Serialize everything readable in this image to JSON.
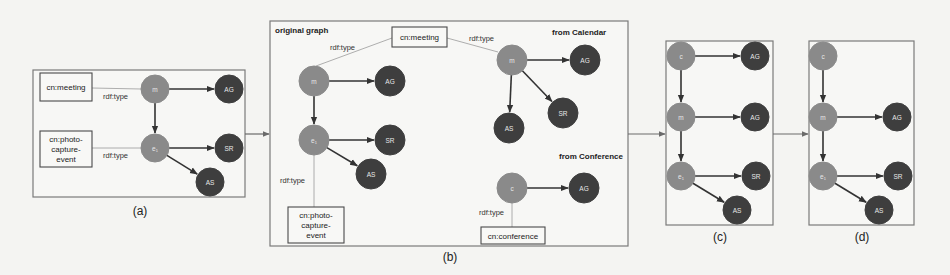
{
  "figure": {
    "background": "#f4f4f2",
    "colors": {
      "light_node": "#8a8a8a",
      "dark_node": "#3e3e3e",
      "edge": "#333333",
      "panel_border": "#7a7a7a"
    },
    "panels": [
      {
        "id": "a",
        "caption": "(a)",
        "rect": [
          33,
          70,
          212,
          127
        ],
        "caption_pos": [
          140,
          215
        ],
        "title": null,
        "type_boxes": [
          {
            "id": "a-meeting",
            "lines": [
              "cn:meeting"
            ],
            "rect": [
              40,
              73,
              52,
              28
            ]
          },
          {
            "id": "a-photo",
            "lines": [
              "cn:photo-",
              "capture-",
              "event"
            ],
            "rect": [
              40,
              131,
              52,
              36
            ]
          }
        ],
        "nodes": [
          {
            "id": "a-m",
            "label": "m",
            "tone": "light",
            "x": 155,
            "y": 89,
            "r": 14
          },
          {
            "id": "a-AG",
            "label": "AG",
            "tone": "dark",
            "x": 229,
            "y": 89,
            "r": 14
          },
          {
            "id": "a-e1",
            "label": "e₁",
            "tone": "light",
            "x": 155,
            "y": 148,
            "r": 14
          },
          {
            "id": "a-SR",
            "label": "SR",
            "tone": "dark",
            "x": 229,
            "y": 148,
            "r": 14
          },
          {
            "id": "a-AS",
            "label": "AS",
            "tone": "dark",
            "x": 210,
            "y": 182,
            "r": 14
          }
        ],
        "edges": [
          {
            "from": "a-m",
            "to": "a-AG"
          },
          {
            "from": "a-m",
            "to": "a-e1"
          },
          {
            "from": "a-e1",
            "to": "a-SR"
          },
          {
            "from": "a-e1",
            "to": "a-AS"
          }
        ],
        "type_edges": [
          {
            "x1": 92,
            "y1": 88,
            "x2": 141,
            "y2": 89,
            "label": "rdf:type",
            "lx": 103,
            "ly": 99
          },
          {
            "x1": 92,
            "y1": 148,
            "x2": 141,
            "y2": 148,
            "label": "rdf:type",
            "lx": 103,
            "ly": 158
          }
        ],
        "sub_titles": []
      },
      {
        "id": "b",
        "caption": "(b)",
        "rect": [
          270,
          21,
          358,
          225
        ],
        "caption_pos": [
          450,
          261
        ],
        "title": {
          "text": "original graph",
          "x": 275,
          "y": 33
        },
        "type_boxes": [
          {
            "id": "b-meeting",
            "lines": [
              "cn:meeting"
            ],
            "rect": [
              392,
              27,
              55,
              20
            ]
          },
          {
            "id": "b-photo",
            "lines": [
              "cn:photo-",
              "capture-",
              "event"
            ],
            "rect": [
              288,
              207,
              56,
              36
            ]
          },
          {
            "id": "b-conference",
            "lines": [
              "cn:conference"
            ],
            "rect": [
              481,
              227,
              64,
              17
            ]
          }
        ],
        "nodes": [
          {
            "id": "b-m",
            "label": "m",
            "tone": "light",
            "x": 314,
            "y": 81,
            "r": 15
          },
          {
            "id": "b-AG",
            "label": "AG",
            "tone": "dark",
            "x": 390,
            "y": 81,
            "r": 15
          },
          {
            "id": "b-e1",
            "label": "e₁",
            "tone": "light",
            "x": 314,
            "y": 140,
            "r": 15
          },
          {
            "id": "b-SR",
            "label": "SR",
            "tone": "dark",
            "x": 390,
            "y": 140,
            "r": 15
          },
          {
            "id": "b-AS",
            "label": "AS",
            "tone": "dark",
            "x": 371,
            "y": 174,
            "r": 15
          },
          {
            "id": "b-cm",
            "label": "m",
            "tone": "light",
            "x": 512,
            "y": 60,
            "r": 15
          },
          {
            "id": "b-cAG",
            "label": "AG",
            "tone": "dark",
            "x": 585,
            "y": 60,
            "r": 15
          },
          {
            "id": "b-cAS",
            "label": "AS",
            "tone": "dark",
            "x": 509,
            "y": 128,
            "r": 15
          },
          {
            "id": "b-cSR",
            "label": "SR",
            "tone": "dark",
            "x": 563,
            "y": 113,
            "r": 15
          },
          {
            "id": "b-cc",
            "label": "c",
            "tone": "light",
            "x": 512,
            "y": 188,
            "r": 15
          },
          {
            "id": "b-ccAG",
            "label": "AG",
            "tone": "dark",
            "x": 584,
            "y": 188,
            "r": 15
          }
        ],
        "edges": [
          {
            "from": "b-m",
            "to": "b-AG"
          },
          {
            "from": "b-m",
            "to": "b-e1"
          },
          {
            "from": "b-e1",
            "to": "b-SR"
          },
          {
            "from": "b-e1",
            "to": "b-AS"
          },
          {
            "from": "b-cm",
            "to": "b-cAG"
          },
          {
            "from": "b-cm",
            "to": "b-cAS"
          },
          {
            "from": "b-cm",
            "to": "b-cSR"
          },
          {
            "from": "b-cc",
            "to": "b-ccAG"
          }
        ],
        "type_edges": [
          {
            "x1": 392,
            "y1": 38,
            "x2": 316,
            "y2": 66,
            "label": "rdf:type",
            "lx": 330,
            "ly": 50
          },
          {
            "x1": 447,
            "y1": 38,
            "x2": 498,
            "y2": 52,
            "label": "rdf:type",
            "lx": 469,
            "ly": 41
          },
          {
            "x1": 314,
            "y1": 155,
            "x2": 314,
            "y2": 207,
            "label": "rdf:type",
            "lx": 280,
            "ly": 183
          },
          {
            "x1": 512,
            "y1": 203,
            "x2": 512,
            "y2": 227,
            "label": "rdf:type",
            "lx": 479,
            "ly": 215
          }
        ],
        "sub_titles": [
          {
            "text": "from Calendar",
            "x": 552,
            "y": 35
          },
          {
            "text": "from Conference",
            "x": 559,
            "y": 159
          }
        ]
      },
      {
        "id": "c",
        "caption": "(c)",
        "rect": [
          666,
          41,
          107,
          184
        ],
        "caption_pos": [
          720,
          241
        ],
        "title": null,
        "type_boxes": [],
        "nodes": [
          {
            "id": "c-c",
            "label": "c",
            "tone": "light",
            "x": 681,
            "y": 56,
            "r": 14
          },
          {
            "id": "c-AG1",
            "label": "AG",
            "tone": "dark",
            "x": 755,
            "y": 56,
            "r": 14
          },
          {
            "id": "c-m",
            "label": "m",
            "tone": "light",
            "x": 681,
            "y": 117,
            "r": 14
          },
          {
            "id": "c-AG2",
            "label": "AG",
            "tone": "dark",
            "x": 755,
            "y": 117,
            "r": 14
          },
          {
            "id": "c-e1",
            "label": "e₁",
            "tone": "light",
            "x": 681,
            "y": 176,
            "r": 14
          },
          {
            "id": "c-SR",
            "label": "SR",
            "tone": "dark",
            "x": 756,
            "y": 176,
            "r": 14
          },
          {
            "id": "c-AS",
            "label": "AS",
            "tone": "dark",
            "x": 737,
            "y": 210,
            "r": 14
          }
        ],
        "edges": [
          {
            "from": "c-c",
            "to": "c-AG1"
          },
          {
            "from": "c-c",
            "to": "c-m"
          },
          {
            "from": "c-m",
            "to": "c-AG2"
          },
          {
            "from": "c-m",
            "to": "c-e1"
          },
          {
            "from": "c-e1",
            "to": "c-SR"
          },
          {
            "from": "c-e1",
            "to": "c-AS"
          }
        ],
        "type_edges": [],
        "sub_titles": []
      },
      {
        "id": "d",
        "caption": "(d)",
        "rect": [
          809,
          41,
          105,
          184
        ],
        "caption_pos": [
          862,
          241
        ],
        "title": null,
        "type_boxes": [],
        "nodes": [
          {
            "id": "d-c",
            "label": "c",
            "tone": "light",
            "x": 823,
            "y": 56,
            "r": 14
          },
          {
            "id": "d-m",
            "label": "m",
            "tone": "light",
            "x": 823,
            "y": 117,
            "r": 14
          },
          {
            "id": "d-AG",
            "label": "AG",
            "tone": "dark",
            "x": 897,
            "y": 117,
            "r": 14
          },
          {
            "id": "d-e1",
            "label": "e₁",
            "tone": "light",
            "x": 823,
            "y": 176,
            "r": 14
          },
          {
            "id": "d-SR",
            "label": "SR",
            "tone": "dark",
            "x": 898,
            "y": 176,
            "r": 14
          },
          {
            "id": "d-AS",
            "label": "AS",
            "tone": "dark",
            "x": 879,
            "y": 210,
            "r": 14
          }
        ],
        "edges": [
          {
            "from": "d-c",
            "to": "d-m"
          },
          {
            "from": "d-m",
            "to": "d-AG"
          },
          {
            "from": "d-m",
            "to": "d-e1"
          },
          {
            "from": "d-e1",
            "to": "d-SR"
          },
          {
            "from": "d-e1",
            "to": "d-AS"
          }
        ],
        "type_edges": [],
        "sub_titles": []
      }
    ],
    "flow_arrows": [
      {
        "x1": 245,
        "y1": 134,
        "x2": 270,
        "y2": 134
      },
      {
        "x1": 628,
        "y1": 134,
        "x2": 666,
        "y2": 134
      },
      {
        "x1": 773,
        "y1": 134,
        "x2": 809,
        "y2": 134
      }
    ]
  }
}
